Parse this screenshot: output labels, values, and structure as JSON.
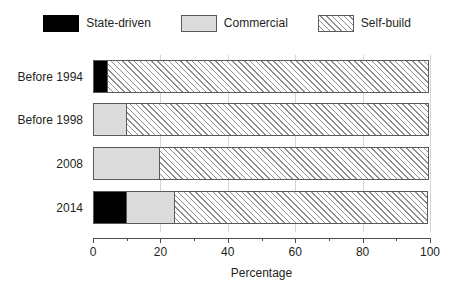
{
  "chart_data": {
    "type": "bar",
    "orientation": "horizontal",
    "stacked": true,
    "title": "",
    "subtitle": "",
    "xlabel": "Percentage",
    "ylabel": "",
    "xlim": [
      0,
      100
    ],
    "xticks": [
      0,
      20,
      40,
      60,
      80,
      100
    ],
    "xtick_labels": [
      "0",
      "20",
      "40",
      "60",
      "80",
      "100"
    ],
    "minor_xticks": [
      10,
      30,
      50,
      70,
      90
    ],
    "grid": true,
    "grid_axis": "x",
    "legend_position": "top",
    "categories": [
      "Before 1994",
      "Before 1998",
      "2008",
      "2014"
    ],
    "series": [
      {
        "name": "State-driven",
        "color": "#000000",
        "pattern": "solid",
        "values": [
          4.5,
          0,
          0,
          10
        ]
      },
      {
        "name": "Commercial",
        "color": "#dcdcdc",
        "pattern": "solid",
        "values": [
          0,
          10,
          20,
          14.5
        ]
      },
      {
        "name": "Self-build",
        "color": "#ffffff",
        "pattern": "diagonal-hatch",
        "values": [
          95.5,
          90,
          80,
          75.5
        ]
      }
    ]
  },
  "legend": {
    "items": [
      {
        "label": "State-driven",
        "swatch_class": "fill-state",
        "icon": "legend-swatch-black"
      },
      {
        "label": "Commercial",
        "swatch_class": "fill-commercial",
        "icon": "legend-swatch-gray"
      },
      {
        "label": "Self-build",
        "swatch_class": "fill-self",
        "icon": "legend-swatch-hatched"
      }
    ]
  },
  "axis": {
    "xlabel": "Percentage",
    "ticks": [
      {
        "value": "0"
      },
      {
        "value": "20"
      },
      {
        "value": "40"
      },
      {
        "value": "60"
      },
      {
        "value": "80"
      },
      {
        "value": "100"
      }
    ]
  },
  "bars": [
    {
      "category": "Before 1994",
      "segments": [
        {
          "series": "State-driven",
          "value": 4.5,
          "class": "fill-state"
        },
        {
          "series": "Self-build",
          "value": 95.5,
          "class": "fill-self"
        }
      ]
    },
    {
      "category": "Before 1998",
      "segments": [
        {
          "series": "Commercial",
          "value": 10,
          "class": "fill-commercial"
        },
        {
          "series": "Self-build",
          "value": 90,
          "class": "fill-self"
        }
      ]
    },
    {
      "category": "2008",
      "segments": [
        {
          "series": "Commercial",
          "value": 20,
          "class": "fill-commercial"
        },
        {
          "series": "Self-build",
          "value": 80,
          "class": "fill-self"
        }
      ]
    },
    {
      "category": "2014",
      "segments": [
        {
          "series": "State-driven",
          "value": 10,
          "class": "fill-state"
        },
        {
          "series": "Commercial",
          "value": 14.5,
          "class": "fill-commercial"
        },
        {
          "series": "Self-build",
          "value": 75.5,
          "class": "fill-self"
        }
      ]
    }
  ]
}
